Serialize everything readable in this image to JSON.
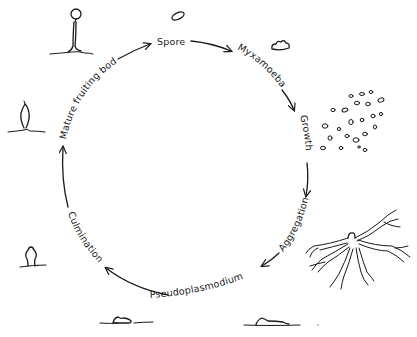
{
  "diagram": {
    "stages": [
      {
        "id": "spore",
        "label": "Spore"
      },
      {
        "id": "myxamoeba",
        "label": "Myxamoeba"
      },
      {
        "id": "growth",
        "label": "Growth"
      },
      {
        "id": "aggregation",
        "label": "Aggregation"
      },
      {
        "id": "pseudoplasmodium",
        "label": "Pseudoplasmodium"
      },
      {
        "id": "culmination",
        "label": "Culmination"
      },
      {
        "id": "mature-fruiting-body",
        "label": "Mature fruiting body"
      }
    ],
    "flow_direction": "clockwise",
    "colors": {
      "ink": "#1a1a1a",
      "background": "#ffffff"
    }
  }
}
